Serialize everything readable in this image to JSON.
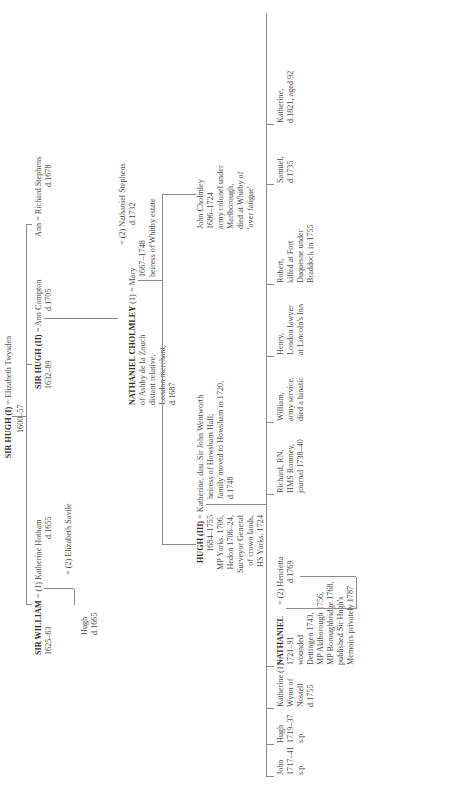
{
  "tree": {
    "root": {
      "name": "SIR HUGH (I)",
      "spouse": "= Elizabeth Twysden",
      "dates": "1600–57"
    },
    "gen2": {
      "william": {
        "name": "SIR WILLIAM",
        "dates": "1625–63",
        "spouse1": "= (1) Katherine Hotham",
        "spouse1_d": "d.1655",
        "spouse2": "= (2) Elizabeth Savile"
      },
      "hugh_son": {
        "name": "Hugh",
        "d": "d.1665"
      },
      "hugh2": {
        "name": "SIR HUGH (II)",
        "dates": "1632–89",
        "spouse": "= Ann Compton",
        "spouse_d": "d.1705"
      },
      "ann": {
        "name": "Ann",
        "spouse": "= Richard Stephens",
        "spouse_d": "d.1678"
      }
    },
    "gen3": {
      "nathaniel_c": {
        "name": "NATHANIEL CHOLMLEY",
        "lines": [
          "of Ashby de la Zouch",
          "distant relative,",
          "London merchant,",
          "d.1687"
        ]
      },
      "mary": {
        "prefix": "(1) = Mary",
        "lines": [
          "1667–1748",
          "heiress of Whitby estate"
        ],
        "spouse2": "= (2) Nathaniel Stephens",
        "spouse2_d": "d.1732"
      },
      "hugh3": {
        "name": "HUGH (III)",
        "lines": [
          "1684–1755",
          "MP Yorks. 1706,",
          "Hedon 1706–24,",
          "Surveyor General",
          "of crown lands,",
          "HS Yorks. 1724"
        ],
        "spouse": "= Katherine, dau. Sir John Wentworth",
        "spouse_lines": [
          "heiress of Howsham Hall;",
          "family moved to Howsham in 1720,",
          "d.1748"
        ]
      },
      "john_c": {
        "name": "John Cholmley",
        "lines": [
          "1686–1724",
          "army colonel under",
          "Marlborough,",
          "died at Whitby of",
          "'over fatigue'"
        ]
      }
    },
    "gen4": [
      {
        "name": "John",
        "lines": [
          "1717–41",
          "s.p."
        ]
      },
      {
        "name": "Hugh",
        "lines": [
          "1719–37",
          "s.p."
        ]
      },
      {
        "name": "Katherine (1) =",
        "lines": [
          "Wynn of",
          "Nostell",
          "d.1755"
        ]
      },
      {
        "name": "NATHANIEL",
        "lines": [
          "1721–91",
          "wounded",
          "Dettingen 1743,",
          "MP Aldborough 1756,",
          "MP Boroughbridge 1768,",
          "published Sir Hugh's",
          "Memoirs privately 1787"
        ],
        "spouse2": "= (2) Henrietta",
        "spouse2_d": "d.1769"
      },
      {
        "name": "Richard, RN,",
        "lines": [
          "HMS Romney,",
          "journal 1738–40"
        ]
      },
      {
        "name": "William,",
        "lines": [
          "army service,",
          "died a lunatic"
        ]
      },
      {
        "name": "Henry,",
        "lines": [
          "London lawyer",
          "at Lincoln's Inn"
        ]
      },
      {
        "name": "Robert,",
        "lines": [
          "killed at Fort",
          "Duquesne under",
          "Braddock in 1755"
        ]
      },
      {
        "name": "Samuel,",
        "lines": [
          "d.1735"
        ]
      },
      {
        "name": "Katherine,",
        "lines": [
          "d.1821, aged 92"
        ]
      }
    ]
  }
}
